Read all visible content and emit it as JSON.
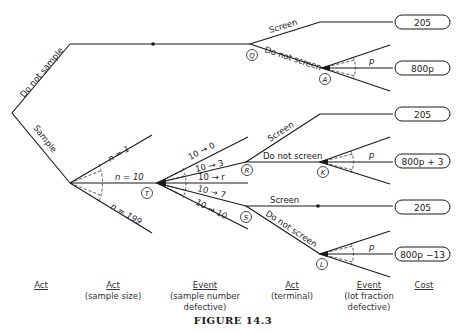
{
  "tree": {
    "root_branches": {
      "do_not_sample": "Do not sample",
      "sample": "Sample"
    },
    "sample_sizes": {
      "n1": "n = 1",
      "n10": "n = 10",
      "n199": "n = 199"
    },
    "sample_outcomes": {
      "o0": "10 → 0",
      "o3": "10 → 3",
      "or": "10 → r",
      "o7": "10 → 7",
      "o10": "10 → 10"
    },
    "terminal_acts": {
      "screen": "Screen",
      "do_not_screen": "Do not screen"
    },
    "fraction_label": "p",
    "nodes": {
      "Q": "Q",
      "A": "A",
      "T": "T",
      "R": "R",
      "K": "K",
      "S": "S",
      "L": "L"
    },
    "costs": [
      "205",
      "800p",
      "205",
      "800p + 3",
      "205",
      "800p −13"
    ]
  },
  "columns": [
    {
      "heading": "Act",
      "sub1": "",
      "sub2": ""
    },
    {
      "heading": "Act",
      "sub1": "(sample size)",
      "sub2": ""
    },
    {
      "heading": "Event",
      "sub1": "(sample number",
      "sub2": "defective)"
    },
    {
      "heading": "Act",
      "sub1": "(terminal)",
      "sub2": ""
    },
    {
      "heading": "Event",
      "sub1": "(lot fraction",
      "sub2": "defective)"
    },
    {
      "heading": "Cost",
      "sub1": "",
      "sub2": ""
    }
  ],
  "caption": "FIGURE 14.3"
}
